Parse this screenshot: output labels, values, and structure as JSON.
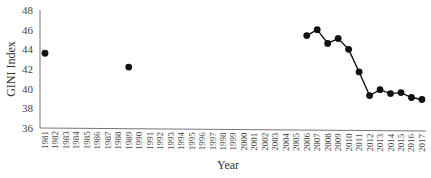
{
  "chart_data": {
    "type": "line",
    "title": "",
    "xlabel": "Year",
    "ylabel": "GINI Index",
    "ylim": [
      36,
      48
    ],
    "yticks": [
      36,
      38,
      40,
      42,
      44,
      46,
      48
    ],
    "grid": false,
    "legend": null,
    "categories": [
      "1981",
      "1982",
      "1983",
      "1984",
      "1985",
      "1986",
      "1987",
      "1988",
      "1989",
      "1990",
      "1991",
      "1992",
      "1993",
      "1994",
      "1995",
      "1996",
      "1997",
      "1998",
      "1999",
      "2000",
      "2001",
      "2002",
      "2003",
      "2004",
      "2005",
      "2006",
      "2007",
      "2008",
      "2009",
      "2010",
      "2011",
      "2012",
      "2013",
      "2014",
      "2015",
      "2016",
      "2017"
    ],
    "series": [
      {
        "name": "GINI Index",
        "color": "#111111",
        "marker": "circle",
        "points": [
          {
            "x": "1981",
            "y": 43.6
          },
          {
            "x": "1989",
            "y": 42.2
          },
          {
            "x": "2006",
            "y": 45.4
          },
          {
            "x": "2007",
            "y": 46.0
          },
          {
            "x": "2008",
            "y": 44.6
          },
          {
            "x": "2009",
            "y": 45.1
          },
          {
            "x": "2010",
            "y": 44.0
          },
          {
            "x": "2011",
            "y": 41.7
          },
          {
            "x": "2012",
            "y": 39.3
          },
          {
            "x": "2013",
            "y": 39.9
          },
          {
            "x": "2014",
            "y": 39.5
          },
          {
            "x": "2015",
            "y": 39.6
          },
          {
            "x": "2016",
            "y": 39.1
          },
          {
            "x": "2017",
            "y": 38.9
          }
        ],
        "connected_from": "2006"
      }
    ]
  }
}
